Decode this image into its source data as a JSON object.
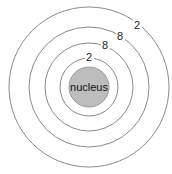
{
  "diagram": {
    "type": "bohr-atom-model",
    "nucleus": {
      "label": "nucleus",
      "fill": "#bdbdbd"
    },
    "shells": [
      {
        "electrons": "2"
      },
      {
        "electrons": "8"
      },
      {
        "electrons": "8"
      },
      {
        "electrons": "2"
      }
    ]
  }
}
